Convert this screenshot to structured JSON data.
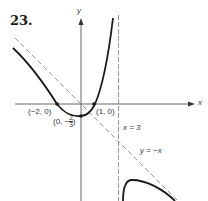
{
  "problem": {
    "number": "23."
  },
  "axes": {
    "x_label": "x",
    "y_label": "y",
    "origin_px": [
      81,
      104
    ],
    "unit_px": 12.5
  },
  "asymptotes": {
    "vertical": {
      "label": "x = 3",
      "x": 3
    },
    "oblique": {
      "label": "y = −x",
      "slope": -1,
      "intercept": 0
    }
  },
  "points": [
    {
      "label": "(−2, 0)",
      "x": -2,
      "y": 0
    },
    {
      "label_prefix": "(0, −",
      "label_num": "2",
      "label_den": "3",
      "label_suffix": ")",
      "x": 0,
      "y": -0.6667
    },
    {
      "label": "(1, 0)",
      "x": 1,
      "y": 0
    }
  ],
  "colors": {
    "curve": "#1a1a1a",
    "axis": "#555555",
    "dashed": "#8a8a8a",
    "text": "#333333"
  }
}
